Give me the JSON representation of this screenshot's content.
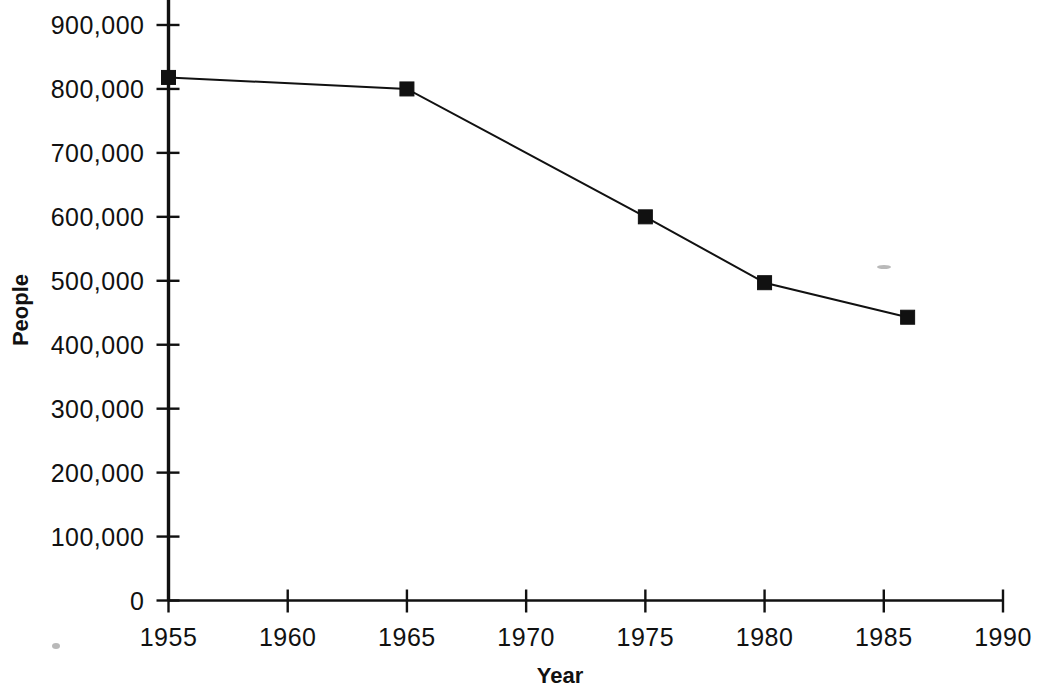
{
  "chart_data": {
    "type": "line",
    "title": "",
    "xlabel": "Year",
    "ylabel": "People",
    "x": [
      1955,
      1965,
      1975,
      1980,
      1986
    ],
    "values": [
      818000,
      800000,
      600000,
      497000,
      443000
    ],
    "series": [
      {
        "name": "People",
        "x": [
          1955,
          1965,
          1975,
          1980,
          1986
        ],
        "values": [
          818000,
          800000,
          600000,
          497000,
          443000
        ]
      }
    ],
    "xlim": [
      1955,
      1990
    ],
    "ylim": [
      0,
      900000
    ],
    "x_ticks": [
      1955,
      1960,
      1965,
      1970,
      1975,
      1980,
      1985,
      1990
    ],
    "x_tick_labels": [
      "1955",
      "1960",
      "1965",
      "1970",
      "1975",
      "1980",
      "1985",
      "1990"
    ],
    "y_ticks": [
      0,
      100000,
      200000,
      300000,
      400000,
      500000,
      600000,
      700000,
      800000,
      900000
    ],
    "y_tick_labels": [
      "0",
      "100,000",
      "200,000",
      "300,000",
      "400,000",
      "500,000",
      "600,000",
      "700,000",
      "800,000",
      "900,000"
    ],
    "grid": false,
    "legend": false,
    "marker": "square",
    "line_color": "#111111",
    "marker_color": "#111111",
    "background_color": "#ffffff"
  }
}
